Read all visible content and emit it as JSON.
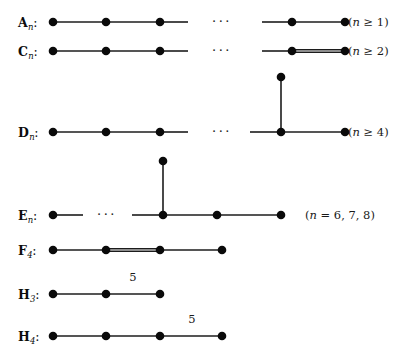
{
  "figure": {
    "width": 417,
    "height": 362,
    "background": "#ffffff",
    "ink_color": "#0a0a0a"
  },
  "rows": [
    {
      "id": "An",
      "label_base": "A",
      "label_sub": "n",
      "label_colon": ":",
      "label_x": 18,
      "label_y": 22,
      "note": "(n ≥ 1)",
      "note_html": "(<i>n</i> ≥ 1)",
      "note_x": 348,
      "note_y": 22,
      "nodes": [
        {
          "x": 53,
          "y": 22
        },
        {
          "x": 106,
          "y": 22
        },
        {
          "x": 160,
          "y": 22
        },
        {
          "x": 292,
          "y": 22
        },
        {
          "x": 345,
          "y": 22
        }
      ],
      "edges": [
        {
          "x1": 53,
          "y1": 22,
          "x2": 106,
          "y2": 22,
          "type": "single"
        },
        {
          "x1": 106,
          "y1": 22,
          "x2": 160,
          "y2": 22,
          "type": "single"
        },
        {
          "x1": 160,
          "y1": 22,
          "x2": 188,
          "y2": 22,
          "type": "stub"
        },
        {
          "x1": 262,
          "y1": 22,
          "x2": 292,
          "y2": 22,
          "type": "stub"
        },
        {
          "x1": 292,
          "y1": 22,
          "x2": 345,
          "y2": 22,
          "type": "single"
        }
      ],
      "ellipsis": {
        "x": 222,
        "y": 21,
        "text": "···"
      },
      "edge_labels": []
    },
    {
      "id": "Cn",
      "label_base": "C",
      "label_sub": "n",
      "label_colon": ":",
      "label_x": 18,
      "label_y": 51,
      "note": "(n ≥ 2)",
      "note_html": "(<i>n</i> ≥ 2)",
      "note_x": 348,
      "note_y": 51,
      "nodes": [
        {
          "x": 53,
          "y": 51
        },
        {
          "x": 106,
          "y": 51
        },
        {
          "x": 160,
          "y": 51
        },
        {
          "x": 292,
          "y": 51
        },
        {
          "x": 345,
          "y": 51
        }
      ],
      "edges": [
        {
          "x1": 53,
          "y1": 51,
          "x2": 106,
          "y2": 51,
          "type": "single"
        },
        {
          "x1": 106,
          "y1": 51,
          "x2": 160,
          "y2": 51,
          "type": "single"
        },
        {
          "x1": 160,
          "y1": 51,
          "x2": 188,
          "y2": 51,
          "type": "stub"
        },
        {
          "x1": 262,
          "y1": 51,
          "x2": 292,
          "y2": 51,
          "type": "stub"
        },
        {
          "x1": 292,
          "y1": 51,
          "x2": 345,
          "y2": 51,
          "type": "double"
        }
      ],
      "ellipsis": {
        "x": 222,
        "y": 50,
        "text": "···"
      },
      "edge_labels": []
    },
    {
      "id": "Dn",
      "label_base": "D",
      "label_sub": "n",
      "label_colon": ":",
      "label_x": 18,
      "label_y": 132,
      "note": "(n ≥ 4)",
      "note_html": "(<i>n</i> ≥ 4)",
      "note_x": 348,
      "note_y": 132,
      "nodes": [
        {
          "x": 53,
          "y": 132
        },
        {
          "x": 106,
          "y": 132
        },
        {
          "x": 160,
          "y": 132
        },
        {
          "x": 281,
          "y": 132
        },
        {
          "x": 281,
          "y": 77
        },
        {
          "x": 345,
          "y": 132
        }
      ],
      "edges": [
        {
          "x1": 53,
          "y1": 132,
          "x2": 106,
          "y2": 132,
          "type": "single"
        },
        {
          "x1": 106,
          "y1": 132,
          "x2": 160,
          "y2": 132,
          "type": "single"
        },
        {
          "x1": 160,
          "y1": 132,
          "x2": 188,
          "y2": 132,
          "type": "stub"
        },
        {
          "x1": 250,
          "y1": 132,
          "x2": 281,
          "y2": 132,
          "type": "stub"
        },
        {
          "x1": 281,
          "y1": 132,
          "x2": 345,
          "y2": 132,
          "type": "single"
        },
        {
          "x1": 281,
          "y1": 132,
          "x2": 281,
          "y2": 77,
          "type": "single"
        }
      ],
      "ellipsis": {
        "x": 222,
        "y": 131,
        "text": "···"
      },
      "edge_labels": []
    },
    {
      "id": "En",
      "label_base": "E",
      "label_sub": "n",
      "label_colon": ":",
      "label_x": 18,
      "label_y": 215,
      "note": "(n = 6, 7, 8)",
      "note_html": "(<i>n</i> = 6, 7, 8)",
      "note_x": 305,
      "note_y": 215,
      "nodes": [
        {
          "x": 53,
          "y": 215
        },
        {
          "x": 163,
          "y": 215
        },
        {
          "x": 163,
          "y": 161
        },
        {
          "x": 217,
          "y": 215
        },
        {
          "x": 281,
          "y": 215
        }
      ],
      "edges": [
        {
          "x1": 53,
          "y1": 215,
          "x2": 83,
          "y2": 215,
          "type": "stub"
        },
        {
          "x1": 132,
          "y1": 215,
          "x2": 163,
          "y2": 215,
          "type": "stub"
        },
        {
          "x1": 163,
          "y1": 215,
          "x2": 217,
          "y2": 215,
          "type": "single"
        },
        {
          "x1": 217,
          "y1": 215,
          "x2": 281,
          "y2": 215,
          "type": "single"
        },
        {
          "x1": 163,
          "y1": 215,
          "x2": 163,
          "y2": 161,
          "type": "single"
        }
      ],
      "ellipsis": {
        "x": 107,
        "y": 214,
        "text": "···"
      },
      "edge_labels": []
    },
    {
      "id": "F4",
      "label_base": "F",
      "label_sub": "4",
      "label_colon": ":",
      "label_x": 18,
      "label_y": 250,
      "note": "",
      "note_html": "",
      "note_x": 0,
      "note_y": 0,
      "nodes": [
        {
          "x": 53,
          "y": 250
        },
        {
          "x": 106,
          "y": 250
        },
        {
          "x": 160,
          "y": 250
        },
        {
          "x": 222,
          "y": 250
        }
      ],
      "edges": [
        {
          "x1": 53,
          "y1": 250,
          "x2": 106,
          "y2": 250,
          "type": "single"
        },
        {
          "x1": 106,
          "y1": 250,
          "x2": 160,
          "y2": 250,
          "type": "double"
        },
        {
          "x1": 160,
          "y1": 250,
          "x2": 222,
          "y2": 250,
          "type": "single"
        }
      ],
      "ellipsis": null,
      "edge_labels": []
    },
    {
      "id": "H3",
      "label_base": "H",
      "label_sub": "3",
      "label_colon": ":",
      "label_x": 18,
      "label_y": 294,
      "note": "",
      "note_html": "",
      "note_x": 0,
      "note_y": 0,
      "nodes": [
        {
          "x": 53,
          "y": 294
        },
        {
          "x": 106,
          "y": 294
        },
        {
          "x": 160,
          "y": 294
        }
      ],
      "edges": [
        {
          "x1": 53,
          "y1": 294,
          "x2": 106,
          "y2": 294,
          "type": "single"
        },
        {
          "x1": 106,
          "y1": 294,
          "x2": 160,
          "y2": 294,
          "type": "single"
        }
      ],
      "ellipsis": null,
      "edge_labels": [
        {
          "text": "5",
          "x": 133,
          "y": 277
        }
      ]
    },
    {
      "id": "H4",
      "label_base": "H",
      "label_sub": "4",
      "label_colon": ":",
      "label_x": 18,
      "label_y": 336,
      "note": "",
      "note_html": "",
      "note_x": 0,
      "note_y": 0,
      "nodes": [
        {
          "x": 53,
          "y": 336
        },
        {
          "x": 106,
          "y": 336
        },
        {
          "x": 160,
          "y": 336
        },
        {
          "x": 222,
          "y": 336
        }
      ],
      "edges": [
        {
          "x1": 53,
          "y1": 336,
          "x2": 106,
          "y2": 336,
          "type": "single"
        },
        {
          "x1": 106,
          "y1": 336,
          "x2": 160,
          "y2": 336,
          "type": "single"
        },
        {
          "x1": 160,
          "y1": 336,
          "x2": 222,
          "y2": 336,
          "type": "single"
        }
      ],
      "ellipsis": null,
      "edge_labels": [
        {
          "text": "5",
          "x": 192,
          "y": 319
        }
      ]
    }
  ],
  "style": {
    "node_radius": 4.3,
    "edge_width": 1.6,
    "double_gap": 2.6
  }
}
